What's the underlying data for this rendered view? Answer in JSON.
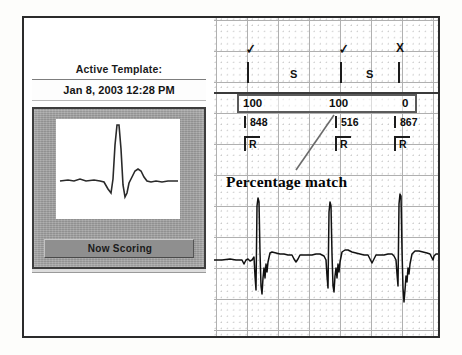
{
  "window": {
    "title": "ECG Template Scoring"
  },
  "left_panel": {
    "active_template_label": "Active Template:",
    "template_date": "Jan 8, 2003 12:28 PM",
    "now_scoring_label": "Now Scoring",
    "preview_name": "template-beat-waveform"
  },
  "ecg_panel": {
    "caption": "Percentage match",
    "beats": [
      {
        "marker_icon": "check-icon",
        "marker_glyph": "✓",
        "percent": "100",
        "interval": "848",
        "rhythm_label": "R"
      },
      {
        "marker_icon": "check-icon",
        "marker_glyph": "✓",
        "percent": "100",
        "interval": "516",
        "rhythm_label": "R"
      },
      {
        "marker_icon": "x-icon",
        "marker_glyph": "X",
        "percent": "0",
        "interval": "867",
        "rhythm_label": "R"
      }
    ],
    "s_labels": [
      "S",
      "S"
    ]
  },
  "colors": {
    "frame_border": "#2b2b2b",
    "grid_minor": "#c8c8c8",
    "grid_major": "#b0b0b0",
    "trace": "#111111",
    "panel_bezel": "#9c9c9c",
    "button_face": "#8f8f8f"
  }
}
